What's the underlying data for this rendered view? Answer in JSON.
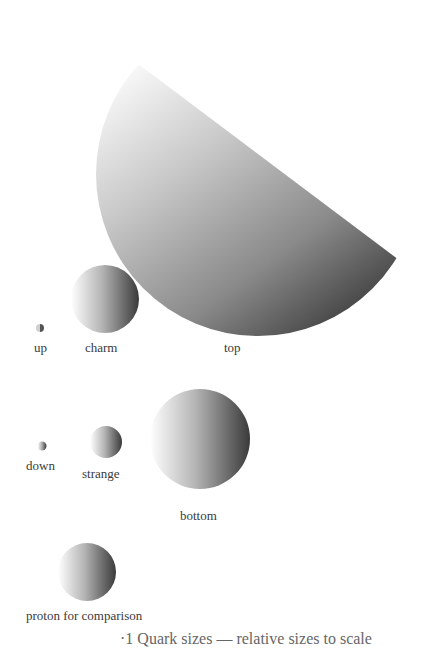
{
  "diagram": {
    "particles": [
      {
        "name": "up",
        "label": "up"
      },
      {
        "name": "charm",
        "label": "charm"
      },
      {
        "name": "top",
        "label": "top"
      },
      {
        "name": "down",
        "label": "down"
      },
      {
        "name": "strange",
        "label": "strange"
      },
      {
        "name": "bottom",
        "label": "bottom"
      },
      {
        "name": "proton",
        "label": "proton for comparison"
      }
    ],
    "caption": "·1 Quark sizes — relative sizes to scale",
    "gradient": {
      "light": "#ffffff",
      "dark": "#2e2e2e"
    }
  }
}
